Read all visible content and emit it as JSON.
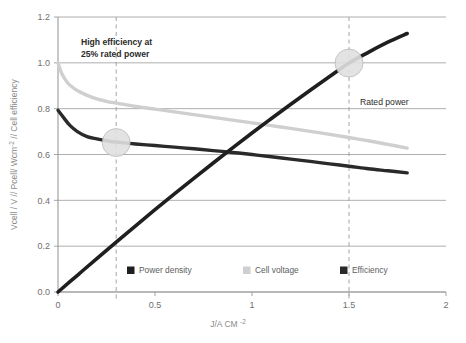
{
  "chart_data": {
    "type": "line",
    "title": "",
    "xlabel": "J/A CM",
    "xlabel_sup": "-2",
    "ylabel": "Vcell / V // Pcell/ Wcm",
    "ylabel_sup": "-2",
    "ylabel_tail": " // Cell efficiency",
    "xlim": [
      0,
      2
    ],
    "ylim": [
      0,
      1.2
    ],
    "grid": true,
    "legend_position": "bottom-inside",
    "xticks": [
      "0",
      "0.5",
      "1",
      "1.5",
      "2"
    ],
    "xtick_values": [
      0,
      0.5,
      1,
      1.5,
      2
    ],
    "yticks": [
      "0.0",
      "0.2",
      "0.4",
      "0.6",
      "0.8",
      "1.0",
      "1.2"
    ],
    "ytick_values": [
      0.0,
      0.2,
      0.4,
      0.6,
      0.8,
      1.0,
      1.2
    ],
    "series": [
      {
        "name": "Power density",
        "color": "#1f1f1f",
        "width": 3.6,
        "x": [
          0.0,
          0.1,
          0.2,
          0.3,
          0.4,
          0.5,
          0.6,
          0.7,
          0.8,
          0.9,
          1.0,
          1.1,
          1.2,
          1.3,
          1.4,
          1.5,
          1.6,
          1.7,
          1.8
        ],
        "values": [
          0.0,
          0.073,
          0.146,
          0.218,
          0.289,
          0.359,
          0.428,
          0.496,
          0.563,
          0.629,
          0.694,
          0.757,
          0.819,
          0.88,
          0.94,
          0.999,
          1.046,
          1.09,
          1.128
        ]
      },
      {
        "name": "Cell voltage",
        "color": "#cfcfcf",
        "width": 3.4,
        "x": [
          0.0,
          0.02,
          0.05,
          0.08,
          0.12,
          0.18,
          0.25,
          0.3,
          0.4,
          0.5,
          0.6,
          0.7,
          0.8,
          0.9,
          1.0,
          1.1,
          1.2,
          1.3,
          1.4,
          1.5,
          1.6,
          1.7,
          1.8
        ],
        "values": [
          1.0,
          0.952,
          0.912,
          0.89,
          0.87,
          0.848,
          0.832,
          0.824,
          0.81,
          0.798,
          0.786,
          0.774,
          0.762,
          0.75,
          0.738,
          0.726,
          0.714,
          0.701,
          0.688,
          0.674,
          0.66,
          0.644,
          0.628
        ]
      },
      {
        "name": "Efficiency",
        "color": "#2a2a2a",
        "width": 3.4,
        "x": [
          0.0,
          0.03,
          0.06,
          0.1,
          0.15,
          0.2,
          0.25,
          0.3,
          0.4,
          0.5,
          0.6,
          0.7,
          0.8,
          0.9,
          1.0,
          1.1,
          1.2,
          1.3,
          1.4,
          1.5,
          1.6,
          1.7,
          1.8
        ],
        "values": [
          0.793,
          0.76,
          0.728,
          0.7,
          0.678,
          0.668,
          0.66,
          0.654,
          0.646,
          0.639,
          0.632,
          0.625,
          0.617,
          0.609,
          0.6,
          0.59,
          0.58,
          0.57,
          0.559,
          0.549,
          0.538,
          0.529,
          0.52
        ]
      }
    ],
    "markers": [
      {
        "name": "high-efficiency-marker",
        "x": 0.3,
        "y": 0.652,
        "radius": 14,
        "fill": "#e0e0e0",
        "stroke": "#b5b5b5"
      },
      {
        "name": "rated-power-marker",
        "x": 1.5,
        "y": 0.999,
        "radius": 14,
        "fill": "#e0e0e0",
        "stroke": "#b5b5b5"
      }
    ],
    "vertical_lines": [
      {
        "name": "high-efficiency-line",
        "x": 0.3
      },
      {
        "name": "rated-power-line",
        "x": 1.5
      }
    ],
    "annotations": [
      {
        "name": "high-efficiency-annotation",
        "line1": "High efficiency at",
        "line2": "25% rated power",
        "x": 0.115,
        "y": 1.125
      },
      {
        "name": "rated-power-annotation",
        "line1": "Rated power",
        "line2": "",
        "x": 1.56,
        "y": 0.875
      }
    ]
  },
  "legend": {
    "items": [
      {
        "label": "Power density",
        "color": "#1f1f1f"
      },
      {
        "label": "Cell voltage",
        "color": "#cfcfcf"
      },
      {
        "label": "Efficiency",
        "color": "#2a2a2a"
      }
    ]
  }
}
